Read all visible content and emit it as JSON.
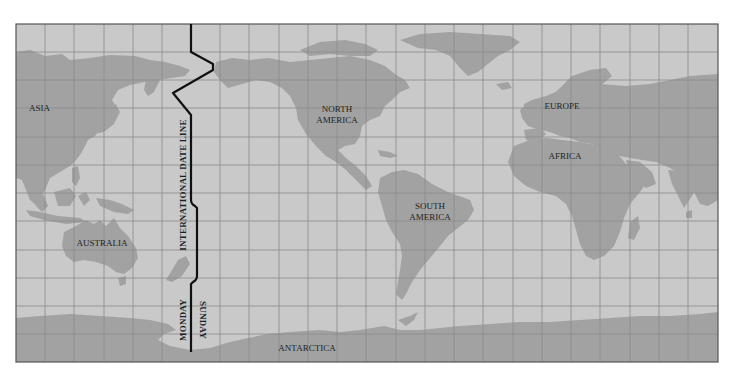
{
  "map": {
    "title": "International Date Line World Map",
    "colors": {
      "ocean": "#c9c9c9",
      "land": "#a2a2a2",
      "grid": "#8a8a8a",
      "border": "#555555",
      "date_line": "#111111",
      "text": "#1e1e1e"
    },
    "continent_labels": {
      "asia": "ASIA",
      "north_america_1": "NORTH",
      "north_america_2": "AMERICA",
      "europe": "EUROPE",
      "africa": "AFRICA",
      "south_america_1": "SOUTH",
      "south_america_2": "AMERICA",
      "australia": "AUSTRALIA",
      "antarctica": "ANTARCTICA"
    },
    "date_line": {
      "label": "INTERNATIONAL DATE LINE",
      "west_day": "MONDAY",
      "east_day": "SUNDAY"
    }
  }
}
